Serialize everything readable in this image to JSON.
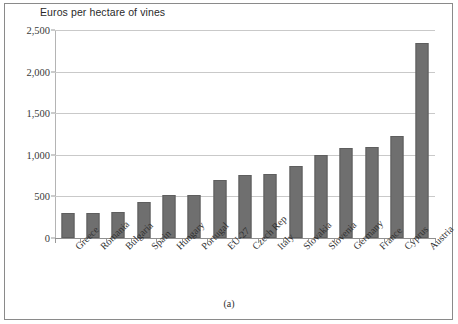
{
  "figure": {
    "caption": "(a)",
    "axis_title": "Euros per hectare of vines"
  },
  "chart_data": {
    "type": "bar",
    "title": "Euros per hectare of vines",
    "xlabel": "",
    "ylabel": "Euros per hectare of vines",
    "ylim": [
      0,
      2500
    ],
    "yticks": [
      0,
      500,
      1000,
      1500,
      2000,
      2500
    ],
    "ytick_labels": [
      "0",
      "500",
      "1,000",
      "1,500",
      "2,000",
      "2,500"
    ],
    "grid": true,
    "legend": "none",
    "bar_color": "#6f6f6f",
    "categories": [
      "Greece",
      "Romania",
      "Bulgaria",
      "Spain",
      "Hungary",
      "Portugal",
      "EU-27",
      "Czech Rep",
      "Italy",
      "Slovakia",
      "Slovenia",
      "Germany",
      "France",
      "Cyprus",
      "Austria"
    ],
    "values": [
      300,
      305,
      315,
      430,
      520,
      520,
      700,
      755,
      765,
      865,
      1000,
      1085,
      1095,
      1225,
      2340
    ]
  }
}
